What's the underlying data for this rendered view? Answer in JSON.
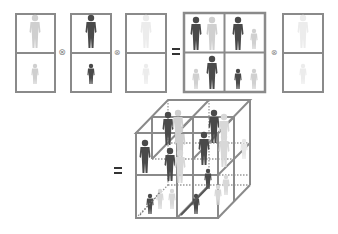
{
  "equation": {
    "top_row": {
      "factors": [
        {
          "id": "factor-1",
          "cells": 2,
          "figure_shade": "light-gray",
          "description": "adult figure top, child figure bottom"
        },
        {
          "id": "factor-2",
          "cells": 2,
          "figure_shade": "dark",
          "description": "adult figure top, child figure bottom"
        },
        {
          "id": "factor-3",
          "cells": 2,
          "figure_shade": "very-light",
          "description": "adult figure top, child figure bottom"
        }
      ],
      "operators": [
        "⊗",
        "⊗"
      ],
      "equals": "=",
      "result_grid": {
        "rows": 2,
        "cols": 2,
        "description": "pairs of figures combining factors 1 and 2"
      },
      "result_operator": "⊗",
      "result_factor": {
        "cells": 2,
        "figure_shade": "very-light"
      }
    },
    "bottom_row": {
      "equals": "=",
      "cube": {
        "dims": [
          2,
          2,
          2
        ],
        "description": "2x2x2 tensor cube with figures in each cell"
      }
    }
  },
  "colors": {
    "frame": "#8a8a8a",
    "dark_figure": "#4a4a4a",
    "light_figure": "#c8c8c8",
    "faint_figure": "#e2e2e2",
    "equals": "#333333",
    "operator": "#8a8a8a"
  }
}
